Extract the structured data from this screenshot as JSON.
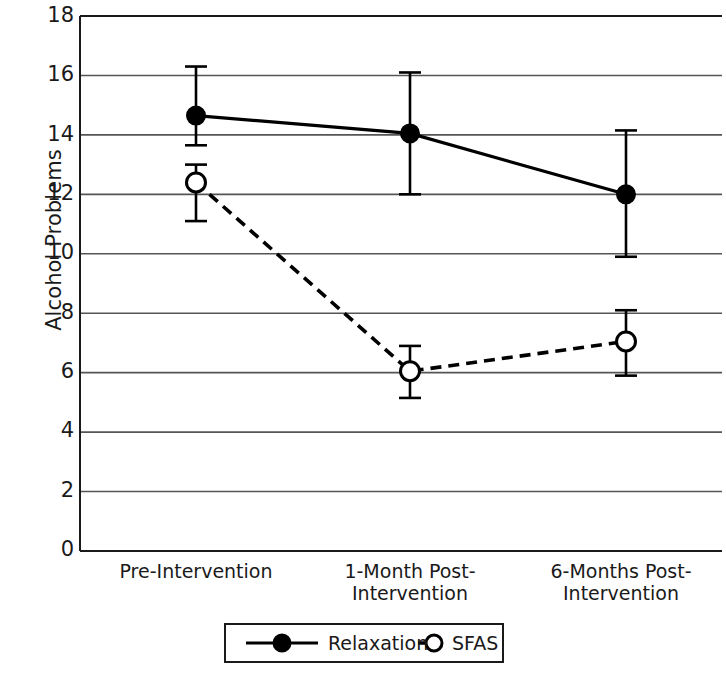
{
  "chart_data": {
    "type": "line",
    "title": "",
    "xlabel": "",
    "ylabel": "Alcohol Problems",
    "categories": [
      "Pre-Intervention",
      "1-Month Post-\nIntervention",
      "6-Months Post-\nIntervention"
    ],
    "ylim": [
      0,
      18
    ],
    "yticks": [
      0,
      2,
      4,
      6,
      8,
      10,
      12,
      14,
      16,
      18
    ],
    "ytick_labels": [
      "0",
      "2",
      "4",
      "6",
      "8",
      "10",
      "12",
      "14",
      "16",
      "18"
    ],
    "grid": "horizontal",
    "legend_position": "below-axes",
    "series": [
      {
        "name": "Relaxation",
        "linestyle": "solid",
        "marker": "filled-circle",
        "color": "#000000",
        "values": [
          14.65,
          14.05,
          12.0
        ],
        "error_low": [
          13.65,
          12.0,
          9.9
        ],
        "error_high": [
          16.3,
          16.1,
          14.15
        ]
      },
      {
        "name": "SFAS",
        "linestyle": "dashed",
        "marker": "open-circle",
        "color": "#000000",
        "values": [
          12.4,
          6.05,
          7.05
        ],
        "error_low": [
          11.1,
          5.15,
          5.9
        ],
        "error_high": [
          13.0,
          6.9,
          8.1
        ]
      }
    ]
  },
  "legend": {
    "entries": [
      {
        "label": "Relaxation",
        "marker": "filled-circle",
        "linestyle": "solid"
      },
      {
        "label": "SFAS",
        "marker": "open-circle",
        "linestyle": "dashed"
      }
    ]
  }
}
